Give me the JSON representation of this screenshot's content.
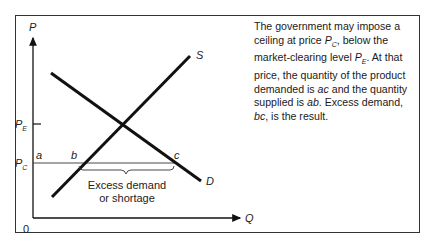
{
  "diagram": {
    "type": "supply-demand price ceiling",
    "axes": {
      "y_label": "P",
      "x_label": "Q",
      "origin_label": "0"
    },
    "curves": [
      {
        "name": "S",
        "label": "S",
        "description": "upward-sloping supply curve"
      },
      {
        "name": "D",
        "label": "D",
        "description": "downward-sloping demand curve"
      }
    ],
    "price_levels": [
      {
        "label": "P",
        "subscript": "E",
        "meaning": "market-clearing price"
      },
      {
        "label": "P",
        "subscript": "C",
        "meaning": "price ceiling"
      }
    ],
    "points": {
      "a": "a",
      "b": "b",
      "c": "c"
    },
    "annotation": {
      "line1": "Excess demand",
      "line2": "or shortage"
    }
  },
  "caption": {
    "seg1": "The government may impose a ceiling at price ",
    "pc_main": "P",
    "pc_sub": "C",
    "seg2": ", below the market-clearing level ",
    "pe_main": "P",
    "pe_sub": "E",
    "seg3": ".  At that price, the quantity of the product demanded is ",
    "ac": "ac",
    "seg4": " and the quantity supplied is ",
    "ab": "ab",
    "seg5": ".  Excess demand, ",
    "bc": "bc",
    "seg6": ", is the result."
  },
  "colors": {
    "line": "#111111",
    "frame": "#333333",
    "text": "#1a1a1a"
  }
}
